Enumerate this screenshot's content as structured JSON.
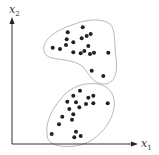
{
  "diagram": {
    "type": "scatter-clusters",
    "axes": {
      "x_label": "x",
      "x_sub": "1",
      "y_label": "x",
      "y_sub": "2"
    },
    "colors": {
      "axis": "#333333",
      "dot": "#222222",
      "outline": "#b0b0b0"
    },
    "clusters": [
      {
        "name": "upper-cluster",
        "points": [
          [
            82.7,
            27.3
          ],
          [
            67.7,
            32.3
          ],
          [
            90.7,
            34
          ],
          [
            86.7,
            36
          ],
          [
            81.7,
            38.3
          ],
          [
            66.7,
            39.3
          ],
          [
            73.3,
            42.3
          ],
          [
            66,
            45
          ],
          [
            52.7,
            47.7
          ],
          [
            60,
            49
          ],
          [
            88.3,
            46
          ],
          [
            73.3,
            52.3
          ],
          [
            80.7,
            53.3
          ],
          [
            84.3,
            51
          ],
          [
            90,
            54
          ],
          [
            94,
            52.7
          ],
          [
            108.3,
            52.7
          ],
          [
            91.7,
            70.7
          ],
          [
            103.3,
            76
          ]
        ]
      },
      {
        "name": "lower-cluster",
        "points": [
          [
            80,
            90.7
          ],
          [
            73.3,
            95.7
          ],
          [
            88.3,
            97.7
          ],
          [
            93.3,
            95.7
          ],
          [
            67.3,
            101.7
          ],
          [
            76,
            102.3
          ],
          [
            93.3,
            103.3
          ],
          [
            86,
            104
          ],
          [
            79.3,
            107.3
          ],
          [
            69.3,
            109
          ],
          [
            107.7,
            103.3
          ],
          [
            73.3,
            114.3
          ],
          [
            62.3,
            116.7
          ],
          [
            72,
            119.7
          ],
          [
            59,
            124.3
          ],
          [
            51.7,
            134
          ],
          [
            76,
            131.7
          ],
          [
            74.3,
            137.3
          ],
          [
            80.7,
            136
          ]
        ]
      }
    ]
  }
}
